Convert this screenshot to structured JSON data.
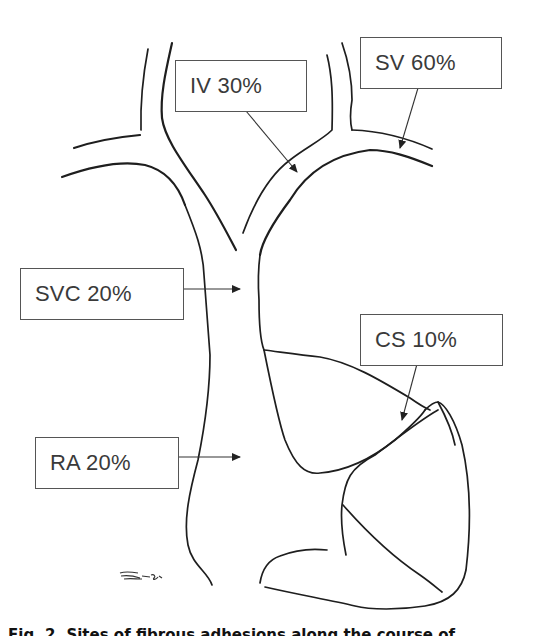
{
  "figure": {
    "labels": [
      {
        "id": "iv",
        "text": "IV 30%",
        "site": "Innominate vein",
        "percent": 30
      },
      {
        "id": "sv",
        "text": "SV 60%",
        "site": "Subclavian vein",
        "percent": 60
      },
      {
        "id": "svc",
        "text": "SVC 20%",
        "site": "Superior vena cava",
        "percent": 20
      },
      {
        "id": "cs",
        "text": "CS 10%",
        "site": "Coronary sinus",
        "percent": 10
      },
      {
        "id": "ra",
        "text": "RA 20%",
        "site": "Right atrium",
        "percent": 20
      }
    ],
    "caption": "Fig. 2. Sites of fibrous adhesions along the course of"
  },
  "colors": {
    "line": "#1e1e1e",
    "box_border": "#555555",
    "text": "#3a3a3a",
    "background": "#ffffff"
  }
}
